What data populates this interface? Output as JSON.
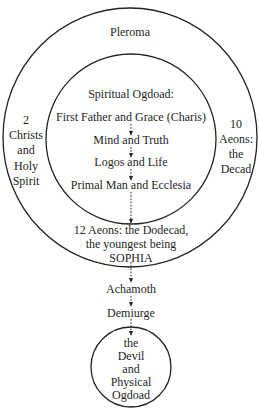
{
  "diagram": {
    "outer_circle": {
      "label": "Pleroma",
      "left_side": [
        "2",
        "Christs",
        "and",
        "Holy",
        "Spirit"
      ],
      "right_side": [
        "10",
        "Aeons:",
        "the",
        "Decad"
      ],
      "bottom_text": [
        "12 Aeons: the Dodecad,",
        "the youngest being",
        "SOPHIA"
      ]
    },
    "inner_circle": {
      "heading": "Spiritual Ogdoad:",
      "chain": [
        "First Father and Grace (Charis)",
        "Mind and Truth",
        "Logos and Life",
        "Primal Man and Ecclesia"
      ]
    },
    "descent": [
      "Achamoth",
      "Demiurge"
    ],
    "bottom_circle": {
      "lines": [
        "the",
        "Devil",
        "and",
        "Physical",
        "Ogdoad"
      ]
    },
    "colors": {
      "stroke": "#222222",
      "text": "#1e1e1e",
      "background": "#ffffff"
    }
  }
}
